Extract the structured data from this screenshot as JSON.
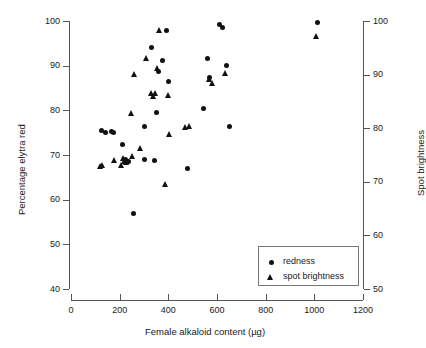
{
  "chart_data": {
    "type": "scatter",
    "title": "",
    "xlabel": "Female alkaloid content (µg)",
    "ylabel": "Percentage elytra red",
    "y2label": "Spot brightness",
    "xlim": [
      0,
      1200
    ],
    "ylim": [
      40,
      100
    ],
    "y2lim": [
      50,
      100
    ],
    "xticks": [
      0,
      200,
      400,
      600,
      800,
      1000,
      1200
    ],
    "yticks": [
      40,
      50,
      60,
      70,
      80,
      90,
      100
    ],
    "y2ticks": [
      50,
      60,
      70,
      80,
      90,
      100
    ],
    "grid": false,
    "legend_position": "bottom-right",
    "series": [
      {
        "name": "redness",
        "marker": "circle",
        "color": "#111111",
        "axis": "left",
        "points": [
          [
            125,
            75.4
          ],
          [
            140,
            75.0
          ],
          [
            168,
            75.3
          ],
          [
            176,
            75.1
          ],
          [
            212,
            72.3
          ],
          [
            222,
            68.9
          ],
          [
            232,
            68.5
          ],
          [
            238,
            68.6
          ],
          [
            258,
            56.9
          ],
          [
            300,
            69.1
          ],
          [
            302,
            76.3
          ],
          [
            330,
            94.0
          ],
          [
            344,
            68.8
          ],
          [
            350,
            79.6
          ],
          [
            360,
            88.6
          ],
          [
            376,
            91.1
          ],
          [
            392,
            97.8
          ],
          [
            400,
            86.4
          ],
          [
            478,
            67.0
          ],
          [
            545,
            80.3
          ],
          [
            560,
            91.5
          ],
          [
            570,
            87.3
          ],
          [
            612,
            99.2
          ],
          [
            622,
            98.6
          ],
          [
            640,
            90.0
          ],
          [
            650,
            76.4
          ],
          [
            1012,
            99.7
          ]
        ]
      },
      {
        "name": "spot brightness",
        "marker": "triangle",
        "color": "#111111",
        "axis": "right",
        "points": [
          [
            120,
            72.9
          ],
          [
            128,
            73.0
          ],
          [
            180,
            74.0
          ],
          [
            208,
            73.0
          ],
          [
            216,
            74.3
          ],
          [
            222,
            73.8
          ],
          [
            228,
            73.5
          ],
          [
            248,
            82.8
          ],
          [
            252,
            74.6
          ],
          [
            262,
            89.9
          ],
          [
            286,
            76.1
          ],
          [
            310,
            93.0
          ],
          [
            332,
            86.4
          ],
          [
            340,
            85.9
          ],
          [
            348,
            86.5
          ],
          [
            356,
            91.1
          ],
          [
            366,
            98.1
          ],
          [
            390,
            69.5
          ],
          [
            400,
            86.1
          ],
          [
            404,
            78.7
          ],
          [
            470,
            80.1
          ],
          [
            486,
            80.3
          ],
          [
            570,
            89.1
          ],
          [
            580,
            88.3
          ],
          [
            636,
            90.2
          ],
          [
            1010,
            97.0
          ]
        ]
      }
    ]
  },
  "legend": {
    "entries": [
      {
        "label": "redness",
        "marker": "circle-icon"
      },
      {
        "label": "spot brightness",
        "marker": "triangle-icon"
      }
    ]
  }
}
